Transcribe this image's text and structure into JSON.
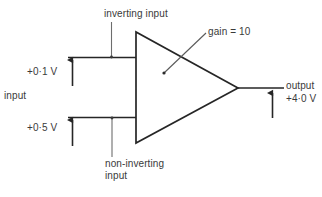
{
  "diagram": {
    "stroke_color": "#262626",
    "text_color": "#3a3a3a",
    "background_color": "#ffffff",
    "labels": {
      "inverting_input": "inverting input",
      "non_inverting_input_line1": "non-inverting",
      "non_inverting_input_line2": "input",
      "gain": "gain = 10",
      "input": "input",
      "voltage_upper": "+0·1 V",
      "voltage_lower": "+0·5 V",
      "output": "output",
      "voltage_output": "+4·0 V"
    },
    "values": {
      "gain": 10,
      "v_inverting": "+0.1 V",
      "v_non_inverting": "+0.5 V",
      "v_output": "+4.0 V"
    },
    "arrows": [
      {
        "name": "upper-input-voltage-arrow",
        "direction": "up"
      },
      {
        "name": "lower-input-voltage-arrow",
        "direction": "up"
      },
      {
        "name": "output-voltage-arrow",
        "direction": "up"
      }
    ]
  }
}
